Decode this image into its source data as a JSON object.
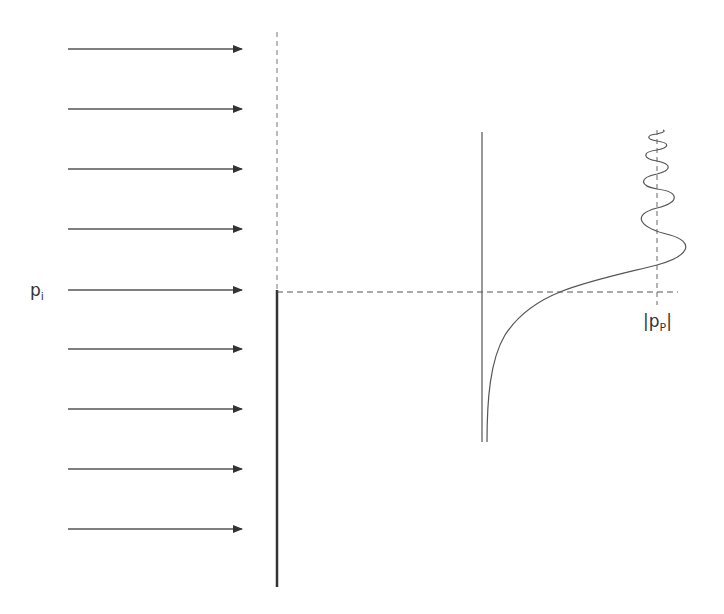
{
  "diagram": {
    "incident_label": {
      "symbol": "p",
      "subscript": "i"
    },
    "amplitude_label": {
      "prefix": "|",
      "symbol": "p",
      "subscript": "P",
      "suffix": "|"
    },
    "arrow_count": 9,
    "arrows_y": [
      49,
      109,
      169,
      229,
      290,
      349,
      409,
      469,
      529
    ],
    "colors": {
      "stroke": "#444444",
      "dashed": "#555555",
      "text": "#333333"
    }
  }
}
